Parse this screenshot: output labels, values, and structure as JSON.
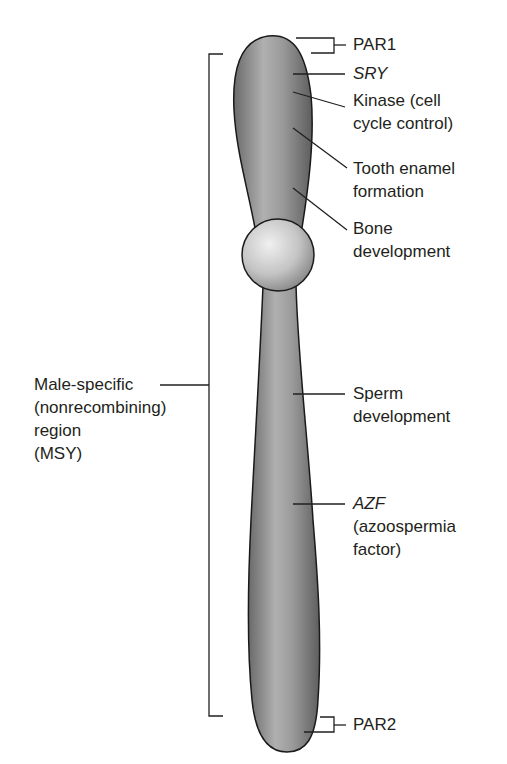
{
  "figure": {
    "colors": {
      "chromosome_fill_dark": "#6e6e6e",
      "chromosome_fill_light": "#b5b5b5",
      "centromere_light": "#e6e6e6",
      "centromere_dark": "#8a8a8a",
      "outline": "#1a1a1a",
      "leader_line": "#231f20",
      "text": "#231f20"
    }
  },
  "labels": {
    "par1": "PAR1",
    "sry": "SRY",
    "kinase_line1": "Kinase (cell",
    "kinase_line2": "cycle control)",
    "tooth_line1": "Tooth enamel",
    "tooth_line2": "formation",
    "bone_line1": "Bone",
    "bone_line2": "development",
    "sperm_line1": "Sperm",
    "sperm_line2": "development",
    "azf_line1": "AZF",
    "azf_line2": "(azoospermia",
    "azf_line3": "factor)",
    "par2": "PAR2",
    "msy_line1": "Male-specific",
    "msy_line2": "(nonrecombining)",
    "msy_line3": "region",
    "msy_line4": "(MSY)"
  }
}
